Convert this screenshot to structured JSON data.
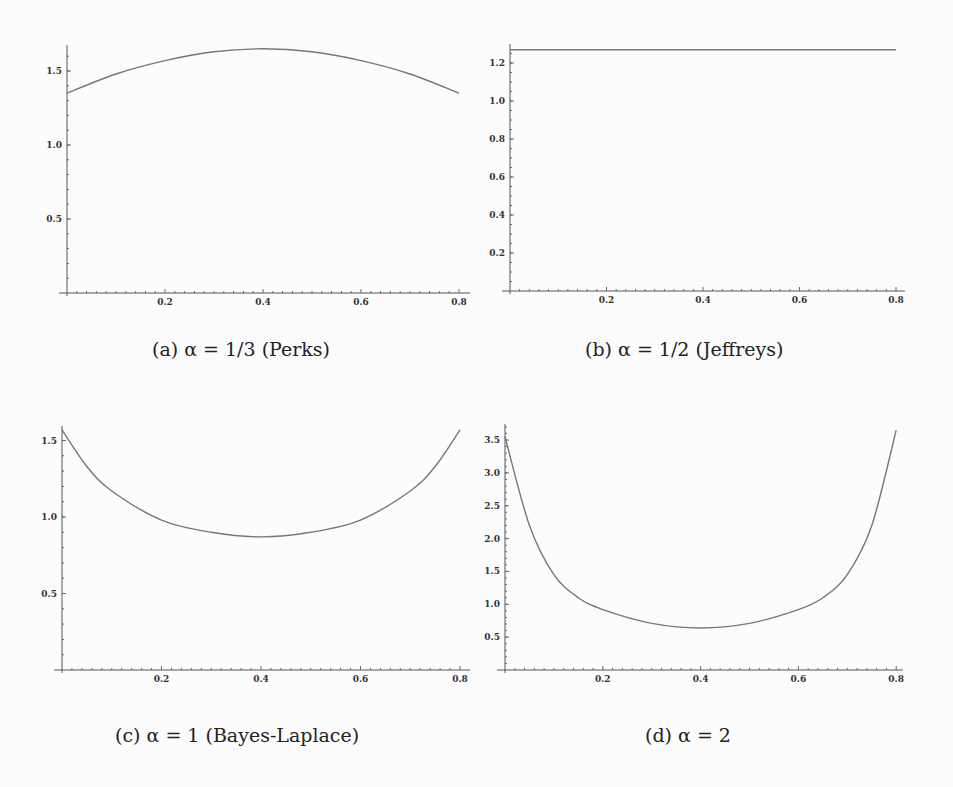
{
  "figure": {
    "panels": [
      {
        "id": "a",
        "caption": "(a) α = 1/3 (Perks)"
      },
      {
        "id": "b",
        "caption": "(b) α = 1/2 (Jeffreys)"
      },
      {
        "id": "c",
        "caption": "(c) α = 1 (Bayes-Laplace)"
      },
      {
        "id": "d",
        "caption": "(d) α = 2"
      }
    ]
  },
  "chart_data": [
    {
      "type": "line",
      "title": "(a) α = 1/3 (Perks)",
      "xlabel": "",
      "ylabel": "",
      "xlim": [
        0,
        0.8
      ],
      "ylim": [
        0,
        1.65
      ],
      "xticks": [
        "0.2",
        "0.4",
        "0.6",
        "0.8"
      ],
      "yticks": [
        "0.5",
        "1.0",
        "1.5"
      ],
      "grid": false,
      "x": [
        0,
        0.1,
        0.2,
        0.3,
        0.4,
        0.5,
        0.6,
        0.7,
        0.8
      ],
      "values": [
        1.35,
        1.48,
        1.57,
        1.63,
        1.65,
        1.63,
        1.57,
        1.48,
        1.35
      ]
    },
    {
      "type": "line",
      "title": "(b) α = 1/2 (Jeffreys)",
      "xlabel": "",
      "ylabel": "",
      "xlim": [
        0,
        0.8
      ],
      "ylim": [
        0,
        1.3
      ],
      "xticks": [
        "0.2",
        "0.4",
        "0.6",
        "0.8"
      ],
      "yticks": [
        "0.2",
        "0.4",
        "0.6",
        "0.8",
        "1.0",
        "1.2"
      ],
      "grid": false,
      "x": [
        0,
        0.2,
        0.4,
        0.6,
        0.8
      ],
      "values": [
        1.27,
        1.27,
        1.27,
        1.27,
        1.27
      ]
    },
    {
      "type": "line",
      "title": "(c) α = 1 (Bayes-Laplace)",
      "xlabel": "",
      "ylabel": "",
      "xlim": [
        0,
        0.8
      ],
      "ylim": [
        0,
        1.58
      ],
      "xticks": [
        "0.2",
        "0.4",
        "0.6",
        "0.8"
      ],
      "yticks": [
        "0.5",
        "1.0",
        "1.5"
      ],
      "grid": false,
      "x": [
        0,
        0.05,
        0.1,
        0.2,
        0.3,
        0.4,
        0.5,
        0.6,
        0.7,
        0.75,
        0.8
      ],
      "values": [
        1.57,
        1.33,
        1.17,
        0.98,
        0.9,
        0.87,
        0.9,
        0.98,
        1.17,
        1.33,
        1.57
      ]
    },
    {
      "type": "line",
      "title": "(d) α = 2",
      "xlabel": "",
      "ylabel": "",
      "xlim": [
        0,
        0.8
      ],
      "ylim": [
        0,
        3.7
      ],
      "xticks": [
        "0.2",
        "0.4",
        "0.6",
        "0.8"
      ],
      "yticks": [
        "0.5",
        "1.0",
        "1.5",
        "2.0",
        "2.5",
        "3.0",
        "3.5"
      ],
      "grid": false,
      "x": [
        0,
        0.05,
        0.1,
        0.15,
        0.2,
        0.3,
        0.4,
        0.5,
        0.6,
        0.65,
        0.7,
        0.75,
        0.8
      ],
      "values": [
        3.55,
        2.2,
        1.45,
        1.1,
        0.92,
        0.71,
        0.64,
        0.71,
        0.92,
        1.1,
        1.45,
        2.2,
        3.65
      ]
    }
  ]
}
